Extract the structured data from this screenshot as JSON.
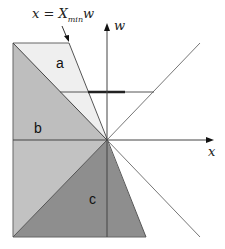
{
  "diagram": {
    "formula_label": {
      "lhs": "x",
      "eq": " = ",
      "var": "X",
      "sub": "min",
      "suffix": "w"
    },
    "axes": {
      "x_label": "x",
      "y_label": "w"
    },
    "regions": [
      {
        "id": "a",
        "label": "a",
        "color": "#eeeeee"
      },
      {
        "id": "b",
        "label": "b",
        "color": "#bdbdbd"
      },
      {
        "id": "c",
        "label": "c",
        "color": "#8f8f8f"
      }
    ],
    "colors": {
      "region_a": "#efefef",
      "region_b_light": "#c4c4c4",
      "region_b_dark": "#b2b2b2",
      "region_c": "#8c8c8c",
      "lines": "#555555",
      "axis": "#333333",
      "thick_segment": "#222222"
    }
  }
}
